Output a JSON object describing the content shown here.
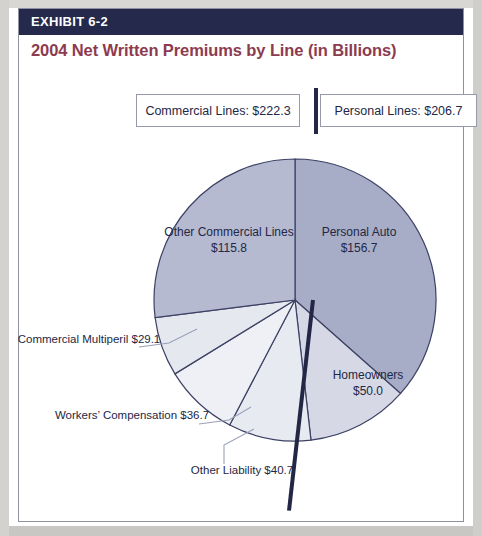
{
  "exhibit": {
    "label": "EXHIBIT 6-2",
    "title": "2004 Net Written Premiums by Line (in Billions)"
  },
  "callouts": {
    "commercial": "Commercial Lines: $222.3",
    "personal": "Personal Lines: $206.7"
  },
  "labels": {
    "personal_auto": {
      "name": "Personal Auto",
      "value": "$156.7"
    },
    "other_commercial": {
      "name": "Other Commercial Lines",
      "value": "$115.8"
    },
    "homeowners": {
      "name": "Homeowners",
      "value": "$50.0"
    },
    "commercial_multiperil": {
      "name": "Commercial Multiperil",
      "value": "$29.1"
    },
    "workers_comp": {
      "name": "Workers’ Compensation",
      "value": "$36.7"
    },
    "other_liability": {
      "name": "Other Liability",
      "value": "$40.7"
    }
  },
  "colors": {
    "header_bar": "#252a4c",
    "title_text": "#8d3b4f",
    "slice_personal_auto": "#a7adc6",
    "slice_other_commercial": "#b5bad1",
    "slice_homeowners": "#d6d9e5",
    "slice_other_liability": "#e8eaf1",
    "slice_workers_comp": "#eff0f5",
    "slice_commercial_multiperil": "#e6e8ef",
    "outline": "#3c4164",
    "divider": "#232745"
  },
  "chart_data": {
    "type": "pie",
    "title": "2004 Net Written Premiums by Line (in Billions)",
    "unit": "billions of dollars",
    "total": 429.0,
    "groups": [
      {
        "name": "Commercial Lines",
        "value": 222.3
      },
      {
        "name": "Personal Lines",
        "value": 206.7
      }
    ],
    "categories": [
      "Personal Auto",
      "Homeowners",
      "Other Liability",
      "Workers’ Compensation",
      "Commercial Multiperil",
      "Other Commercial Lines"
    ],
    "values": [
      156.7,
      50.0,
      40.7,
      36.7,
      29.1,
      115.8
    ],
    "slices": [
      {
        "label": "Personal Auto",
        "value": 156.7,
        "group": "Personal Lines",
        "start_angle": 0.0,
        "end_angle": 131.5,
        "color": "#a7adc6",
        "label_placement": "inside"
      },
      {
        "label": "Homeowners",
        "value": 50.0,
        "group": "Personal Lines",
        "start_angle": 131.5,
        "end_angle": 173.5,
        "color": "#d6d9e5",
        "label_placement": "inside"
      },
      {
        "label": "Other Liability",
        "value": 40.7,
        "group": "Commercial Lines",
        "start_angle": 173.5,
        "end_angle": 207.6,
        "color": "#e8eaf1",
        "label_placement": "outside"
      },
      {
        "label": "Workers’ Compensation",
        "value": 36.7,
        "group": "Commercial Lines",
        "start_angle": 207.6,
        "end_angle": 238.4,
        "color": "#eff0f5",
        "label_placement": "outside"
      },
      {
        "label": "Commercial Multiperil",
        "value": 29.1,
        "group": "Commercial Lines",
        "start_angle": 238.4,
        "end_angle": 262.8,
        "color": "#e6e8ef",
        "label_placement": "outside"
      },
      {
        "label": "Other Commercial Lines",
        "value": 115.8,
        "group": "Commercial Lines",
        "start_angle": 262.8,
        "end_angle": 360.0,
        "color": "#b5bad1",
        "label_placement": "inside"
      }
    ],
    "legend": "none",
    "grid": false
  }
}
